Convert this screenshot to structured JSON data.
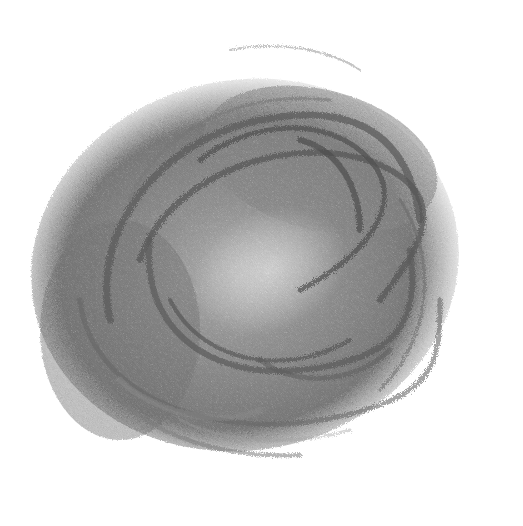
{
  "image": {
    "subject": "abstract gray brush-stroke scribble",
    "background_color": "#ffffff",
    "stroke_colors": [
      "#5a5a5a",
      "#6e6e6e",
      "#8a8a8a",
      "#a8a8a8",
      "#cfcfcf"
    ]
  }
}
